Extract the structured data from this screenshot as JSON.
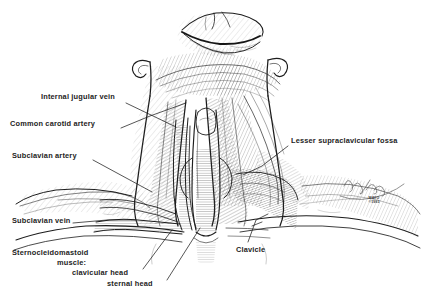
{
  "figure": {
    "kind": "anatomical-illustration",
    "background_color": "#ffffff",
    "ink_color": "#1d1d1d",
    "width": 424,
    "height": 307
  },
  "labels": [
    {
      "id": "internal-jugular-vein",
      "text": "Internal jugular vein",
      "x": 41,
      "y": 96,
      "align": "left",
      "leader": [
        [
          126,
          103
        ],
        [
          176,
          127
        ]
      ]
    },
    {
      "id": "common-carotid-artery",
      "text": "Common carotid artery",
      "x": 10,
      "y": 123,
      "align": "left",
      "leader": [
        [
          121,
          128
        ],
        [
          150,
          116
        ],
        [
          186,
          103
        ]
      ]
    },
    {
      "id": "subclavian-artery",
      "text": "Subclavian artery",
      "x": 12,
      "y": 155,
      "align": "left",
      "leader": [
        [
          93,
          160
        ],
        [
          152,
          192
        ]
      ]
    },
    {
      "id": "subclavian-vein",
      "text": "Subclavian vein",
      "x": 12,
      "y": 220,
      "align": "left",
      "leader": [
        [
          73,
          223
        ],
        [
          107,
          220
        ],
        [
          135,
          220
        ]
      ]
    },
    {
      "id": "sternocleidomastoid-muscle",
      "text": "Sternocleidomastoid",
      "x": 12,
      "y": 252,
      "align": "left",
      "leader": null
    },
    {
      "id": "sternocleidomastoid-muscle-word",
      "text": "muscle:",
      "x": 57,
      "y": 262,
      "align": "left",
      "leader": null
    },
    {
      "id": "clavicular-head",
      "text": "clavicular head",
      "x": 72,
      "y": 272,
      "align": "left",
      "leader": [
        [
          143,
          269
        ],
        [
          172,
          230
        ]
      ]
    },
    {
      "id": "sternal-head",
      "text": "sternal head",
      "x": 107,
      "y": 283,
      "align": "left",
      "leader": [
        [
          167,
          280
        ],
        [
          200,
          228
        ]
      ]
    },
    {
      "id": "lesser-supraclavicular-fossa",
      "text": "Lesser supraclavicular fossa",
      "x": 291,
      "y": 140,
      "align": "left",
      "leader": [
        [
          288,
          146
        ],
        [
          262,
          166
        ],
        [
          243,
          175
        ]
      ]
    },
    {
      "id": "clavicle",
      "text": "Clavicle",
      "x": 236,
      "y": 249,
      "align": "left",
      "leader": [
        [
          248,
          242
        ],
        [
          256,
          220
        ],
        [
          268,
          214
        ]
      ]
    }
  ],
  "credit": {
    "line1": "MAYO",
    "line2": "©1993",
    "x": 374,
    "y": 198
  }
}
